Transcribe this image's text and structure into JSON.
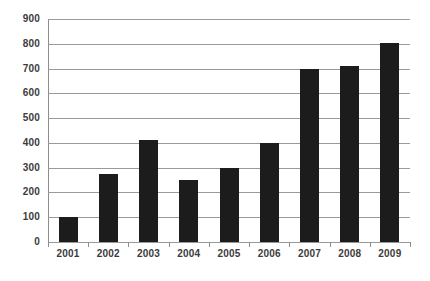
{
  "chart_data": {
    "type": "bar",
    "title": "",
    "subtitle": "",
    "xlabel": "",
    "ylabel": "",
    "categories": [
      "2001",
      "2002",
      "2003",
      "2004",
      "2005",
      "2006",
      "2007",
      "2008",
      "2009"
    ],
    "values": [
      100,
      275,
      410,
      250,
      300,
      400,
      700,
      710,
      805
    ],
    "ylim": [
      0,
      900
    ],
    "ytick_labels": [
      "900",
      "800",
      "700",
      "600",
      "500",
      "400",
      "300",
      "200",
      "100",
      "0"
    ],
    "ytick_values": [
      900,
      800,
      700,
      600,
      500,
      400,
      300,
      200,
      100,
      0
    ],
    "grid": "horizontal",
    "legend": "none",
    "series": [
      {
        "name": "",
        "color": "#1c1c1c",
        "values": [
          100,
          275,
          410,
          250,
          300,
          400,
          700,
          710,
          805
        ]
      }
    ],
    "annotations": []
  },
  "style": {
    "bar_color": "#1c1c1c",
    "gridline_color": "#9a9a9a",
    "axis_color": "#8d8d8d",
    "label_color": "#3b3b3b",
    "background": "#ffffff"
  }
}
